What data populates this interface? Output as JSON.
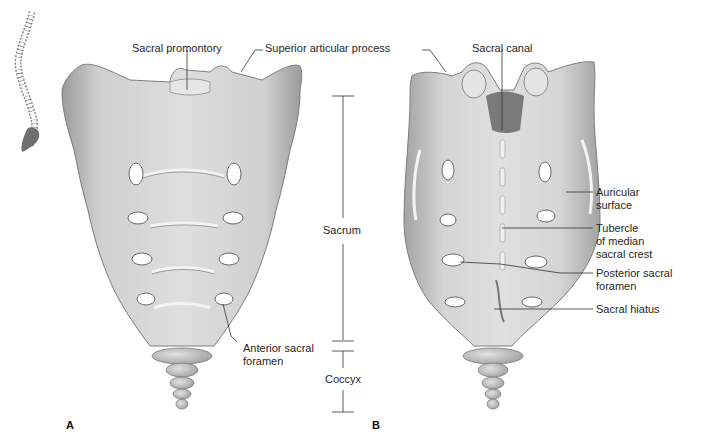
{
  "figure": {
    "panels": [
      {
        "id": "A",
        "label": "A",
        "view": "anterior"
      },
      {
        "id": "B",
        "label": "B",
        "view": "posterior"
      }
    ],
    "colors": {
      "bone": "#c9c9c9",
      "bone_light": "#e4e4e4",
      "bone_shadow": "#8f8f8f",
      "line": "#333333",
      "text": "#262626"
    }
  },
  "labels": {
    "sacral_promontory": "Sacral promontory",
    "superior_articular_process": "Superior articular process",
    "sacral_canal": "Sacral canal",
    "auricular_surface_1": "Auricular",
    "auricular_surface_2": "surface",
    "tubercle_1": "Tubercle",
    "tubercle_2": "of median",
    "tubercle_3": "sacral crest",
    "posterior_foramen_1": "Posterior sacral",
    "posterior_foramen_2": "foramen",
    "sacral_hiatus": "Sacral hiatus",
    "anterior_foramen_1": "Anterior sacral",
    "anterior_foramen_2": "foramen",
    "sacrum": "Sacrum",
    "coccyx": "Coccyx"
  }
}
